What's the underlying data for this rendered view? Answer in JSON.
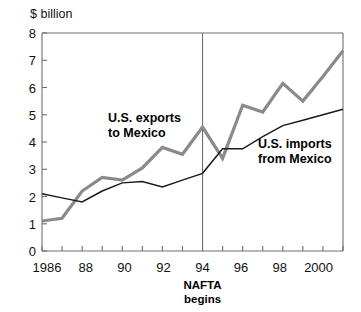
{
  "chart_data": {
    "type": "line",
    "title": "",
    "subtitle": "",
    "ylabel": "$ billion",
    "xlabel": "",
    "ylim": [
      0,
      8
    ],
    "xlim": [
      1986,
      2001
    ],
    "yticks": [
      0,
      1,
      2,
      3,
      4,
      5,
      6,
      7,
      8
    ],
    "ytick_labels": [
      "0",
      "1",
      "2",
      "3",
      "4",
      "5",
      "6",
      "7",
      "8"
    ],
    "xticks": [
      1986,
      1987,
      1988,
      1989,
      1990,
      1991,
      1992,
      1993,
      1994,
      1995,
      1996,
      1997,
      1998,
      1999,
      2000,
      2001
    ],
    "xtick_labels_shown": [
      {
        "x": 1986,
        "label": "1986"
      },
      {
        "x": 1988,
        "label": "88"
      },
      {
        "x": 1990,
        "label": "90"
      },
      {
        "x": 1992,
        "label": "92"
      },
      {
        "x": 1994,
        "label": "94"
      },
      {
        "x": 1996,
        "label": "96"
      },
      {
        "x": 1998,
        "label": "98"
      },
      {
        "x": 2000,
        "label": "2000"
      }
    ],
    "grid": false,
    "legend_position": "inline-annotations",
    "x": [
      1986,
      1987,
      1988,
      1989,
      1990,
      1991,
      1992,
      1993,
      1994,
      1995,
      1996,
      1997,
      1998,
      1999,
      2000,
      2001
    ],
    "series": [
      {
        "name": "U.S. exports to Mexico",
        "color": "#8a8a8a",
        "line_width": 3.2,
        "values": [
          1.1,
          1.2,
          2.2,
          2.7,
          2.6,
          3.05,
          3.8,
          3.55,
          4.55,
          3.4,
          5.35,
          5.1,
          6.15,
          5.5,
          6.4,
          7.35
        ]
      },
      {
        "name": "U.S. imports from Mexico",
        "color": "#1a1a1a",
        "line_width": 1.5,
        "values": [
          2.1,
          1.95,
          1.8,
          2.2,
          2.5,
          2.55,
          2.35,
          2.6,
          2.85,
          3.75,
          3.75,
          4.2,
          4.6,
          4.8,
          5.0,
          5.2
        ]
      }
    ],
    "annotations": [
      {
        "name": "exports-label",
        "text_lines": [
          "U.S. exports",
          "to Mexico"
        ],
        "x_px": 108,
        "y_px": 122
      },
      {
        "name": "imports-label",
        "text_lines": [
          "U.S. imports",
          "from Mexico"
        ],
        "x_px": 258,
        "y_px": 148
      },
      {
        "name": "nafta-marker",
        "text_lines": [
          "NAFTA",
          "begins"
        ],
        "at_x": 1994
      }
    ],
    "vertical_rule": {
      "x": 1994,
      "color": "#6e6e6e",
      "label": "NAFTA begins"
    }
  },
  "labels": {
    "y_axis": "$ billion",
    "exports_line1": "U.S. exports",
    "exports_line2": "to Mexico",
    "imports_line1": "U.S. imports",
    "imports_line2": "from Mexico",
    "nafta_line1": "NAFTA",
    "nafta_line2": "begins",
    "ytick_8": "8",
    "ytick_7": "7",
    "ytick_6": "6",
    "ytick_5": "5",
    "ytick_4": "4",
    "ytick_3": "3",
    "ytick_2": "2",
    "ytick_1": "1",
    "ytick_0": "0",
    "xtick_1986": "1986",
    "xtick_88": "88",
    "xtick_90": "90",
    "xtick_92": "92",
    "xtick_94": "94",
    "xtick_96": "96",
    "xtick_98": "98",
    "xtick_2000": "2000"
  },
  "colors": {
    "exports": "#8a8a8a",
    "imports": "#1a1a1a",
    "axis": "#6e6e6e",
    "background": "#ffffff",
    "text": "#111111"
  }
}
